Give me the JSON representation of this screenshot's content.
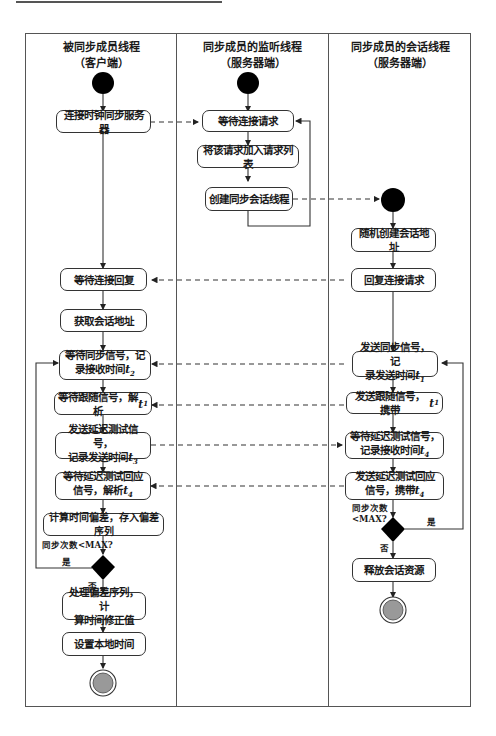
{
  "lanes": [
    {
      "title": "被同步成员线程",
      "subtitle": "（客户端）"
    },
    {
      "title": "同步成员的监听线程",
      "subtitle": "（服务器端）"
    },
    {
      "title": "同步成员的会话线程",
      "subtitle": "（服务器端）"
    }
  ],
  "client": {
    "connect": "连接时钟同步服务器",
    "wait_reply": "等待连接回复",
    "get_addr": "获取会话地址",
    "wait_sync_1": "等待同步信号，记",
    "wait_sync_2": "录接收时间",
    "wait_sync_var": "t",
    "wait_sync_sub": "2",
    "wait_follow": "等待跟随信号，解析",
    "wait_follow_var": "t",
    "wait_follow_sub": "1",
    "send_delay_1": "发送延迟测试信号，",
    "send_delay_2": "记录发送时间",
    "send_delay_var": "t",
    "send_delay_sub": "3",
    "wait_delay_resp_1": "等待延迟测试回应",
    "wait_delay_resp_2": "信号，解析",
    "wait_delay_resp_var": "t",
    "wait_delay_resp_sub": "4",
    "compute": "计算时间偏差，存入偏差序列",
    "condition": "同步次数<MAX?",
    "yes": "是",
    "no": "否",
    "process_1": "处理偏差序列，计",
    "process_2": "算时间修正值",
    "set_time": "设置本地时间"
  },
  "listener": {
    "wait_request": "等待连接请求",
    "add_request": "将该请求加入请求列表",
    "create_session": "创建同步会话线程"
  },
  "session": {
    "create_addr": "随机创建会话地址",
    "reply_request": "回复连接请求",
    "send_sync_1": "发送同步信号，记",
    "send_sync_2": "录发送时间",
    "send_sync_var": "t",
    "send_sync_sub": "1",
    "send_follow": "发送跟随信号，携带",
    "send_follow_var": "t",
    "send_follow_sub": "1",
    "wait_delay_1": "等待延迟测试信号，",
    "wait_delay_2": "记录接收时间",
    "wait_delay_var": "t",
    "wait_delay_sub": "4",
    "send_delay_resp_1": "发送延迟测试回应",
    "send_delay_resp_2": "信号，携带",
    "send_delay_resp_var": "t",
    "send_delay_resp_sub": "4",
    "condition_1": "同步次数",
    "condition_2": "<MAX?",
    "yes": "是",
    "no": "否",
    "release": "释放会话资源"
  }
}
